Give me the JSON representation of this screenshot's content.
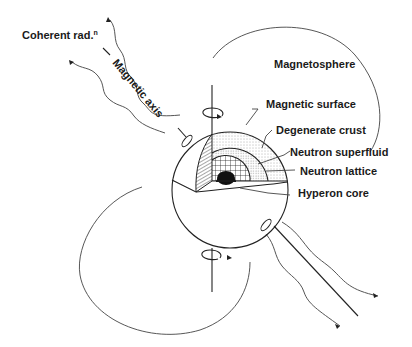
{
  "figure": {
    "labels": {
      "coherent_radiation": "Coherent rad.",
      "coherent_radiation_superscript": "n",
      "magnetic_axis": "Magnetic axis",
      "magnetosphere": "Magnetosphere",
      "magnetic_surface": "Magnetic surface",
      "degenerate_crust": "Degenerate crust",
      "neutron_superfluid": "Neutron superfluid",
      "neutron_lattice": "Neutron lattice",
      "hyperon_core": "Hyperon core"
    },
    "layers": [
      "Magnetic surface",
      "Degenerate crust",
      "Neutron superfluid",
      "Neutron lattice",
      "Hyperon core"
    ],
    "icons": [
      "rotation-arrow-icon",
      "radiation-wave-icon",
      "magnetic-pole-icon"
    ],
    "colors": {
      "ink": "#222222",
      "background": "#ffffff"
    }
  }
}
